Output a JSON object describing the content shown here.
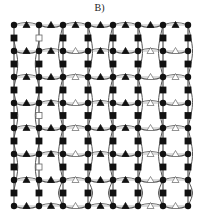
{
  "title": "B)",
  "grid": {
    "columns_x": [
      14,
      39,
      63,
      88,
      113,
      138,
      163,
      188
    ],
    "rows_y": [
      25,
      51,
      77,
      103,
      128,
      154,
      180,
      206
    ]
  },
  "colors": {
    "node": "#111111",
    "edge": "#555555",
    "light_edge": "#aaaaaa",
    "hollow": "#ffffff"
  },
  "hollow_square_column": 1,
  "hollow_square_rows": [
    0,
    3,
    5
  ],
  "hollow_triangle_pairs": [
    [
      2,
      3
    ],
    [
      5,
      6
    ],
    [
      6,
      7
    ]
  ],
  "hollow_triangle_rows": [
    1,
    2,
    3,
    4,
    5,
    6,
    7
  ],
  "legend": {
    "circle": "filled circle node",
    "square": "square node",
    "triangle": "triangle node"
  }
}
